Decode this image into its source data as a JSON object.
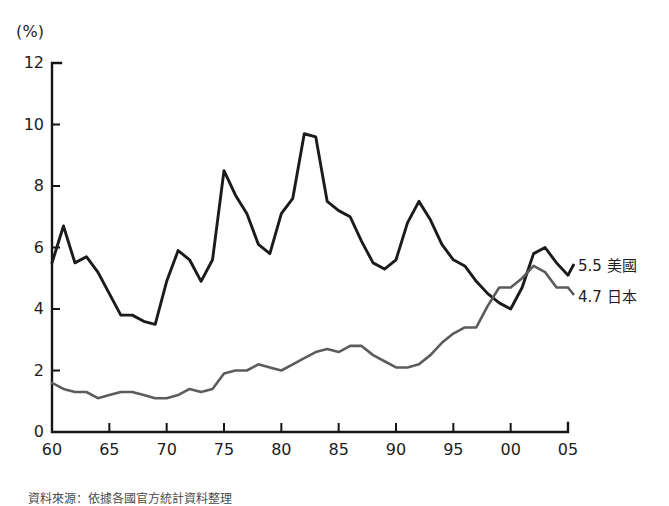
{
  "figure": {
    "unit_label": "(%)",
    "source_note": "資料來源：依據各國官方統計資料整理"
  },
  "legend": {
    "entries": [
      {
        "name": "united-states",
        "value": "5.5",
        "label": "美國",
        "color": "#1b1b1b"
      },
      {
        "name": "japan",
        "value": "4.7",
        "label": "日本",
        "color": "#5c5c5c"
      }
    ]
  },
  "axes": {
    "y_ticks": [
      "0",
      "2",
      "4",
      "6",
      "8",
      "10",
      "12"
    ],
    "x_ticks": [
      "60",
      "65",
      "70",
      "75",
      "80",
      "85",
      "90",
      "95",
      "00",
      "05"
    ]
  },
  "chart_data": {
    "type": "line",
    "title": "",
    "subtitle": "",
    "xlabel": "",
    "ylabel": "(%)",
    "ylim": [
      0,
      12
    ],
    "xlim": [
      1960,
      2005
    ],
    "grid": false,
    "legend_position": "right-end-of-lines",
    "x": [
      1960,
      1961,
      1962,
      1963,
      1964,
      1965,
      1966,
      1967,
      1968,
      1969,
      1970,
      1971,
      1972,
      1973,
      1974,
      1975,
      1976,
      1977,
      1978,
      1979,
      1980,
      1981,
      1982,
      1983,
      1984,
      1985,
      1986,
      1987,
      1988,
      1989,
      1990,
      1991,
      1992,
      1993,
      1994,
      1995,
      1996,
      1997,
      1998,
      1999,
      2000,
      2001,
      2002,
      2003,
      2004,
      2005
    ],
    "series": [
      {
        "name": "美國",
        "name_en": "United States",
        "color": "#1b1b1b",
        "end_value": 5.5,
        "values": [
          5.5,
          6.7,
          5.5,
          5.7,
          5.2,
          4.5,
          3.8,
          3.8,
          3.6,
          3.5,
          4.9,
          5.9,
          5.6,
          4.9,
          5.6,
          8.5,
          7.7,
          7.1,
          6.1,
          5.8,
          7.1,
          7.6,
          9.7,
          9.6,
          7.5,
          7.2,
          7.0,
          6.2,
          5.5,
          5.3,
          5.6,
          6.8,
          7.5,
          6.9,
          6.1,
          5.6,
          5.4,
          4.9,
          4.5,
          4.2,
          4.0,
          4.7,
          5.8,
          6.0,
          5.5,
          5.1
        ]
      },
      {
        "name": "日本",
        "name_en": "Japan",
        "color": "#5c5c5c",
        "end_value": 4.7,
        "values": [
          1.6,
          1.4,
          1.3,
          1.3,
          1.1,
          1.2,
          1.3,
          1.3,
          1.2,
          1.1,
          1.1,
          1.2,
          1.4,
          1.3,
          1.4,
          1.9,
          2.0,
          2.0,
          2.2,
          2.1,
          2.0,
          2.2,
          2.4,
          2.6,
          2.7,
          2.6,
          2.8,
          2.8,
          2.5,
          2.3,
          2.1,
          2.1,
          2.2,
          2.5,
          2.9,
          3.2,
          3.4,
          3.4,
          4.1,
          4.7,
          4.7,
          5.0,
          5.4,
          5.2,
          4.7,
          4.7
        ]
      }
    ]
  }
}
